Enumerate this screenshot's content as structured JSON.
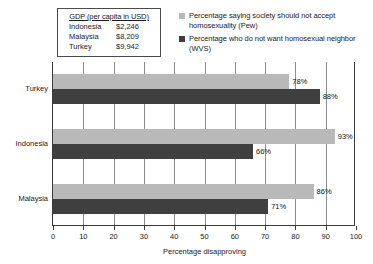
{
  "gdp_table": {
    "title": "GDP (per capita in USD)",
    "rows": [
      {
        "country": "Indonesia",
        "value": "$2,246"
      },
      {
        "country": "Malaysia",
        "value": "$8,209"
      },
      {
        "country": "Turkey",
        "value": "$9,942"
      }
    ]
  },
  "legend": {
    "entries": [
      {
        "label": "Percentage saying society should not accept homosexuality (Pew)",
        "color": "#b9b9b9"
      },
      {
        "label": "Percentage who do not want homosexual neighbor (WVS)",
        "color": "#3f3f3f"
      }
    ]
  },
  "chart_data": {
    "type": "bar",
    "orientation": "horizontal",
    "title": "",
    "xlabel": "Percentage disapproving",
    "ylabel": "",
    "xlim": [
      0,
      100
    ],
    "xticks": [
      0,
      10,
      20,
      30,
      40,
      50,
      60,
      70,
      80,
      90,
      100
    ],
    "xtick_labels": [
      "0",
      "10",
      "20",
      "30",
      "40",
      "50",
      "60",
      "70",
      "80",
      "90",
      "100"
    ],
    "grid": true,
    "grid_axis": "x",
    "legend_position": "top-right",
    "categories": [
      "Turkey",
      "Indonesia",
      "Malaysia"
    ],
    "series": [
      {
        "name": "Percentage saying society should not accept homosexuality (Pew)",
        "color": "#b9b9b9",
        "values": [
          78,
          93,
          86
        ],
        "labels": [
          "78%",
          "93%",
          "86%"
        ]
      },
      {
        "name": "Percentage who do not want homosexual neighbor (WVS)",
        "color": "#3f3f3f",
        "values": [
          88,
          66,
          71
        ],
        "labels": [
          "88%",
          "66%",
          "71%"
        ]
      }
    ]
  }
}
